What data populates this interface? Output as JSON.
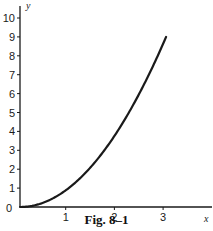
{
  "caption": "Fig. 8–1",
  "colors": {
    "ink": "#1a1a1a",
    "background": "#ffffff"
  },
  "chart_data": {
    "type": "line",
    "title": "",
    "caption": "Fig. 8–1",
    "xlabel": "x",
    "ylabel": "y",
    "xlim": [
      0,
      3.9
    ],
    "ylim": [
      0,
      10.5
    ],
    "x_ticks": [
      1,
      2,
      3
    ],
    "y_ticks": [
      1,
      2,
      3,
      4,
      5,
      6,
      7,
      8,
      9,
      10
    ],
    "origin_label": "0",
    "grid": false,
    "legend": null,
    "series": [
      {
        "name": "y = x^2",
        "x": [
          0,
          0.25,
          0.5,
          0.75,
          1,
          1.25,
          1.5,
          1.75,
          2,
          2.25,
          2.5,
          2.75,
          3
        ],
        "y": [
          0,
          0.0625,
          0.25,
          0.5625,
          1,
          1.5625,
          2.25,
          3.0625,
          4,
          5.0625,
          6.25,
          7.5625,
          9
        ]
      }
    ]
  }
}
